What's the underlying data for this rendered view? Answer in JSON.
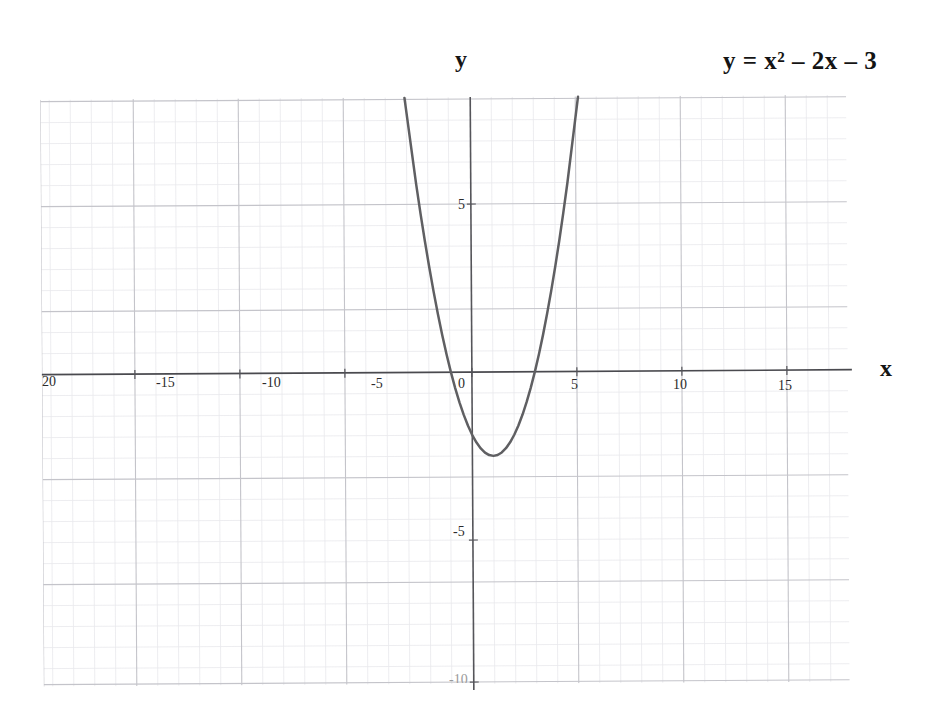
{
  "figure": {
    "equation_label": "y = x² – 2x – 3",
    "x_axis_label": "x",
    "y_axis_label": "y"
  },
  "colors": {
    "curve": "#5f5f62",
    "axis": "#4a4a4a",
    "grid_major": "#c9c9cf",
    "grid_minor": "#e6e6ea",
    "text": "#141414",
    "background": "#ffffff"
  },
  "chart_data": {
    "type": "line",
    "title": "y = x² – 2x – 3",
    "xlabel": "x",
    "ylabel": "y",
    "xlim": [
      -20.5,
      18.0
    ],
    "ylim": [
      -13.5,
      13.5
    ],
    "grid": true,
    "grid_minor_step": 1,
    "grid_major_step": 5,
    "legend": "none",
    "equation": "y = x^2 - 2x - 3",
    "vertex": [
      1,
      -4
    ],
    "roots": [
      -1,
      3
    ],
    "y_intercept": -3,
    "xticks": [
      -20,
      -15,
      -10,
      -5,
      0,
      5,
      10,
      15
    ],
    "xticklabels": [
      "20",
      "-15",
      "-10",
      "-5",
      "0",
      "5",
      "10",
      "15"
    ],
    "yticks": [
      5,
      -5,
      -10
    ],
    "yticklabels": [
      "5",
      "-5",
      "-10"
    ],
    "series": [
      {
        "name": "y = x² – 2x – 3",
        "x": [
          -2.6,
          -2.4,
          -2.2,
          -2.0,
          -1.8,
          -1.6,
          -1.4,
          -1.2,
          -1.0,
          -0.8,
          -0.6,
          -0.4,
          -0.2,
          0.0,
          0.2,
          0.4,
          0.6,
          0.8,
          1.0,
          1.2,
          1.4,
          1.6,
          1.8,
          2.0,
          2.2,
          2.4,
          2.6,
          2.8,
          3.0,
          3.2,
          3.4,
          3.6,
          3.8,
          4.0,
          4.2,
          4.4,
          4.6
        ],
        "y": [
          8.96,
          7.56,
          6.24,
          5.0,
          3.84,
          2.76,
          1.76,
          0.84,
          0.0,
          -0.76,
          -1.44,
          -2.04,
          -2.56,
          -3.0,
          -3.36,
          -3.64,
          -3.84,
          -3.96,
          -4.0,
          -3.96,
          -3.84,
          -3.64,
          -3.36,
          -3.0,
          -2.56,
          -2.04,
          -1.44,
          -0.76,
          0.0,
          0.84,
          1.76,
          2.76,
          3.84,
          5.0,
          6.24,
          7.56,
          8.96
        ]
      }
    ]
  }
}
